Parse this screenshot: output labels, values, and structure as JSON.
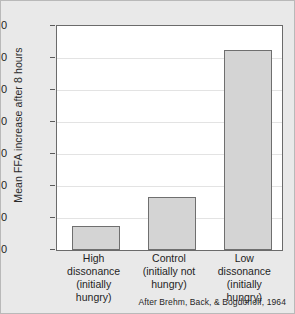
{
  "chart_data": {
    "type": "bar",
    "title": "",
    "xlabel": "",
    "ylabel": "Mean FFA increase after 8 hours",
    "ylim": [
      0,
      700
    ],
    "yticks": [
      0,
      100,
      200,
      300,
      400,
      500,
      600,
      700
    ],
    "ytick_labels": [
      "0",
      "100",
      "200",
      "300",
      "400",
      "500",
      "600",
      "700"
    ],
    "grid": true,
    "legend": "none",
    "categories": [
      "High dissonance (initially hungry)",
      "Control (initially not hungry)",
      "Low dissonance (initially hungry)"
    ],
    "category_lines": [
      [
        "High",
        "dissonance",
        "(initially hungry)"
      ],
      [
        "Control",
        "(initially not",
        "hungry)"
      ],
      [
        "Low",
        "dissonance",
        "(initially hungry)"
      ]
    ],
    "values": [
      75,
      165,
      625
    ],
    "bar_color": "#d4d4d4",
    "bar_edge_color": "#6f6f6f",
    "plot_background": "#ffffff",
    "figure_background": "#e9e9e9",
    "annotation": "After Brehm, Back, & Bogdonoff, 1964"
  }
}
